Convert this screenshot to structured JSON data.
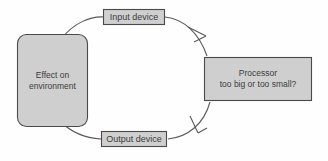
{
  "diagram": {
    "colors": {
      "node_fill": "#cfcfcf",
      "node_stroke": "#4a4a4a",
      "arrow_stroke": "#5a5a5a",
      "text": "#3b3b3b",
      "background": "#fefefe"
    },
    "nodes": [
      {
        "id": "effect",
        "label": "Effect on\nenvironment",
        "shape": "rounded-rectangle"
      },
      {
        "id": "input_device",
        "label": "Input device",
        "shape": "rectangle"
      },
      {
        "id": "processor",
        "label": "Processor\ntoo big or too small?",
        "shape": "rectangle"
      },
      {
        "id": "output_device",
        "label": "Output device",
        "shape": "rectangle"
      }
    ],
    "edges": [
      {
        "id": "effect-to-input",
        "from": "effect",
        "to": "input_device",
        "arrowhead": false
      },
      {
        "id": "input-to-processor",
        "from": "input_device",
        "to": "processor",
        "arrowhead": true
      },
      {
        "id": "processor-to-output",
        "from": "processor",
        "to": "output_device",
        "arrowhead": true
      },
      {
        "id": "output-to-effect",
        "from": "output_device",
        "to": "effect",
        "arrowhead": false
      }
    ]
  }
}
